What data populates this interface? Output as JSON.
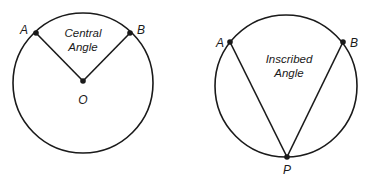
{
  "diagrams": [
    {
      "name": "central-angle",
      "caption_line1": "Central",
      "caption_line2": "Angle",
      "points": {
        "A": "A",
        "B": "B",
        "O": "O"
      }
    },
    {
      "name": "inscribed-angle",
      "caption_line1": "Inscribed",
      "caption_line2": "Angle",
      "points": {
        "A": "A",
        "B": "B",
        "P": "P"
      }
    }
  ],
  "colors": {
    "stroke": "#1a1a1a",
    "background": "#ffffff"
  }
}
